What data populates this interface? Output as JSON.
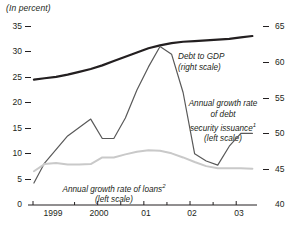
{
  "figure": {
    "unit_note": "(In percent)"
  },
  "axes": {
    "left_ticks": [
      "35",
      "30",
      "25",
      "20",
      "15",
      "10",
      "5",
      "0"
    ],
    "right_ticks": [
      "65",
      "60",
      "55",
      "50",
      "45",
      "40"
    ],
    "x_ticks": [
      "1999",
      "2000",
      "01",
      "02",
      "03"
    ]
  },
  "annotations": {
    "debt_to_gdp": {
      "line1": "Debt to GDP",
      "line2": "(right scale)"
    },
    "debt_security": {
      "line1": "Annual growth rate",
      "line2": "of debt",
      "line3": "security issuance",
      "marker3": "1",
      "line4": "(left scale)"
    },
    "loans": {
      "line1": "Annual growth rate of loans",
      "marker1": "2",
      "line2": "(left scale)"
    }
  },
  "colors": {
    "debt_to_gdp": "#231f20",
    "debt_security": "#595959",
    "loans": "#c9c9c9",
    "axis": "#231f20"
  },
  "chart_data": {
    "type": "line",
    "title": "",
    "subtitle": "",
    "xlabel": "",
    "ylabel": "(In percent)",
    "grid": false,
    "legend": "inline-annotations",
    "x_axis": {
      "tick_labels": [
        "1999",
        "2000",
        "01",
        "02",
        "03"
      ],
      "tick_positions": [
        1999,
        2000,
        2001,
        2002,
        2003
      ],
      "minor_ticks_at_midyear": true,
      "range": [
        1998.6,
        2003.45
      ]
    },
    "y_left": {
      "label": "(left scale)",
      "ticks": [
        0,
        5,
        10,
        15,
        20,
        25,
        30,
        35
      ],
      "ylim": [
        0,
        35
      ]
    },
    "y_right": {
      "label": "(right scale)",
      "ticks": [
        40,
        45,
        50,
        55,
        60,
        65
      ],
      "ylim": [
        40,
        65
      ]
    },
    "series": [
      {
        "name": "Debt to GDP (right scale)",
        "axis": "right",
        "color": "#231f20",
        "width": 2.2,
        "x": [
          1998.62,
          1998.85,
          1999.1,
          1999.35,
          1999.6,
          1999.85,
          2000.1,
          2000.35,
          2000.6,
          2000.85,
          2001.1,
          2001.35,
          2001.6,
          2001.85,
          2002.1,
          2002.35,
          2002.6,
          2002.85,
          2003.1,
          2003.35
        ],
        "values": [
          57.5,
          57.7,
          57.9,
          58.2,
          58.6,
          59.0,
          59.5,
          60.1,
          60.7,
          61.3,
          61.9,
          62.3,
          62.6,
          62.8,
          62.9,
          63.0,
          63.1,
          63.2,
          63.4,
          63.6
        ]
      },
      {
        "name": "Annual growth rate of debt security issuance (left scale)",
        "axis": "left",
        "color": "#595959",
        "width": 1.2,
        "x": [
          1998.62,
          1998.85,
          1999.35,
          1999.85,
          2000.1,
          2000.35,
          2000.6,
          2000.85,
          2001.1,
          2001.35,
          2001.6,
          2001.85,
          2002.1,
          2002.35,
          2002.6,
          2002.85,
          2003.1,
          2003.35
        ],
        "values": [
          4.3,
          8.2,
          13.5,
          16.8,
          13.0,
          13.0,
          17.0,
          22.5,
          27.0,
          31.0,
          29.5,
          22.0,
          10.0,
          8.6,
          7.8,
          11.5,
          14.0,
          14.0
        ]
      },
      {
        "name": "Annual growth rate of loans (left scale)",
        "axis": "left",
        "color": "#c9c9c9",
        "width": 2.0,
        "x": [
          1998.62,
          1998.85,
          1999.1,
          1999.35,
          1999.6,
          1999.85,
          2000.1,
          2000.35,
          2000.6,
          2000.85,
          2001.1,
          2001.35,
          2001.6,
          2001.85,
          2002.1,
          2002.35,
          2002.6,
          2002.85,
          2003.1,
          2003.35
        ],
        "values": [
          6.6,
          8.0,
          8.2,
          7.9,
          7.9,
          8.0,
          9.3,
          9.3,
          9.9,
          10.4,
          10.7,
          10.6,
          10.1,
          9.3,
          8.4,
          7.6,
          7.2,
          7.2,
          7.2,
          7.1
        ]
      }
    ],
    "notes": [
      {
        "marker": "1",
        "attached_to": "security issuance"
      },
      {
        "marker": "2",
        "attached_to": "loans"
      }
    ]
  }
}
